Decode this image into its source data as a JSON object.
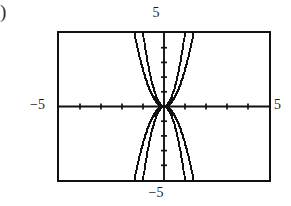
{
  "figure": {
    "part_label": ")",
    "caption": ""
  },
  "labels": {
    "top": "5",
    "bottom": "−5",
    "left": "−5",
    "right": "5"
  },
  "colors": {
    "ink": "#111111",
    "background": "#ffffff",
    "axis": "#111111",
    "curve": "#111111"
  },
  "chart_data": {
    "type": "line",
    "title": "",
    "subtitle": "",
    "xlabel": "",
    "ylabel": "",
    "xlim": [
      -5,
      5
    ],
    "ylim": [
      -5,
      5
    ],
    "grid": false,
    "legend": null,
    "legend_position": "none",
    "xticks": [
      -4,
      -3,
      -2,
      -1,
      1,
      2,
      3,
      4
    ],
    "yticks": [
      -4,
      -3,
      -2,
      -1,
      1,
      2,
      3,
      4
    ],
    "xtick_labels": [
      "-5",
      "5"
    ],
    "ytick_labels": [
      "-5",
      "5"
    ],
    "axis_end_labels": {
      "x_min": "−5",
      "x_max": "5",
      "y_min": "−5",
      "y_max": "5"
    },
    "annotations": [],
    "series": [
      {
        "name": "y = 5x²",
        "equation": "y = 5x^2",
        "coefficient": 5,
        "exponent": 2,
        "opens": "up",
        "points": [
          [
            -1.0,
            5.0
          ],
          [
            -0.9,
            4.05
          ],
          [
            -0.8,
            3.2
          ],
          [
            -0.7,
            2.45
          ],
          [
            -0.6,
            1.8
          ],
          [
            -0.5,
            1.25
          ],
          [
            -0.4,
            0.8
          ],
          [
            -0.3,
            0.45
          ],
          [
            -0.2,
            0.2
          ],
          [
            -0.1,
            0.05
          ],
          [
            0.0,
            0.0
          ],
          [
            0.1,
            0.05
          ],
          [
            0.2,
            0.2
          ],
          [
            0.3,
            0.45
          ],
          [
            0.4,
            0.8
          ],
          [
            0.5,
            1.25
          ],
          [
            0.6,
            1.8
          ],
          [
            0.7,
            2.45
          ],
          [
            0.8,
            3.2
          ],
          [
            0.9,
            4.05
          ],
          [
            1.0,
            5.0
          ]
        ]
      },
      {
        "name": "y = 2.5x²",
        "equation": "y = 2.5x^2",
        "coefficient": 2.5,
        "exponent": 2,
        "opens": "up",
        "points": [
          [
            -1.414,
            5.0
          ],
          [
            -1.3,
            4.23
          ],
          [
            -1.2,
            3.6
          ],
          [
            -1.1,
            3.03
          ],
          [
            -1.0,
            2.5
          ],
          [
            -0.9,
            2.03
          ],
          [
            -0.8,
            1.6
          ],
          [
            -0.7,
            1.23
          ],
          [
            -0.6,
            0.9
          ],
          [
            -0.5,
            0.63
          ],
          [
            -0.4,
            0.4
          ],
          [
            -0.3,
            0.23
          ],
          [
            -0.2,
            0.1
          ],
          [
            -0.1,
            0.03
          ],
          [
            0.0,
            0.0
          ],
          [
            0.1,
            0.03
          ],
          [
            0.2,
            0.1
          ],
          [
            0.3,
            0.23
          ],
          [
            0.4,
            0.4
          ],
          [
            0.5,
            0.63
          ],
          [
            0.6,
            0.9
          ],
          [
            0.7,
            1.23
          ],
          [
            0.8,
            1.6
          ],
          [
            0.9,
            2.03
          ],
          [
            1.0,
            2.5
          ],
          [
            1.1,
            3.03
          ],
          [
            1.2,
            3.6
          ],
          [
            1.3,
            4.23
          ],
          [
            1.414,
            5.0
          ]
        ]
      },
      {
        "name": "y = −5x²",
        "equation": "y = -5x^2",
        "coefficient": -5,
        "exponent": 2,
        "opens": "down",
        "points": [
          [
            -1.0,
            -5.0
          ],
          [
            -0.9,
            -4.05
          ],
          [
            -0.8,
            -3.2
          ],
          [
            -0.7,
            -2.45
          ],
          [
            -0.6,
            -1.8
          ],
          [
            -0.5,
            -1.25
          ],
          [
            -0.4,
            -0.8
          ],
          [
            -0.3,
            -0.45
          ],
          [
            -0.2,
            -0.2
          ],
          [
            -0.1,
            -0.05
          ],
          [
            0.0,
            0.0
          ],
          [
            0.1,
            -0.05
          ],
          [
            0.2,
            -0.2
          ],
          [
            0.3,
            -0.45
          ],
          [
            0.4,
            -0.8
          ],
          [
            0.5,
            -1.25
          ],
          [
            0.6,
            -1.8
          ],
          [
            0.7,
            -2.45
          ],
          [
            0.8,
            -3.2
          ],
          [
            0.9,
            -4.05
          ],
          [
            1.0,
            -5.0
          ]
        ]
      },
      {
        "name": "y = −2.5x²",
        "equation": "y = -2.5x^2",
        "coefficient": -2.5,
        "exponent": 2,
        "opens": "down",
        "points": [
          [
            -1.414,
            -5.0
          ],
          [
            -1.3,
            -4.23
          ],
          [
            -1.2,
            -3.6
          ],
          [
            -1.1,
            -3.03
          ],
          [
            -1.0,
            -2.5
          ],
          [
            -0.9,
            -2.03
          ],
          [
            -0.8,
            -1.6
          ],
          [
            -0.7,
            -1.23
          ],
          [
            -0.6,
            -0.9
          ],
          [
            -0.5,
            -0.63
          ],
          [
            -0.4,
            -0.4
          ],
          [
            -0.3,
            -0.23
          ],
          [
            -0.2,
            -0.1
          ],
          [
            -0.1,
            -0.03
          ],
          [
            0.0,
            0.0
          ],
          [
            0.1,
            -0.03
          ],
          [
            0.2,
            -0.1
          ],
          [
            0.3,
            -0.23
          ],
          [
            0.4,
            -0.4
          ],
          [
            0.5,
            -0.63
          ],
          [
            0.6,
            -0.9
          ],
          [
            0.7,
            -1.23
          ],
          [
            0.8,
            -1.6
          ],
          [
            0.9,
            -2.03
          ],
          [
            1.0,
            -2.5
          ],
          [
            1.1,
            -3.03
          ],
          [
            1.2,
            -3.6
          ],
          [
            1.3,
            -4.23
          ],
          [
            1.414,
            -5.0
          ]
        ]
      }
    ]
  }
}
